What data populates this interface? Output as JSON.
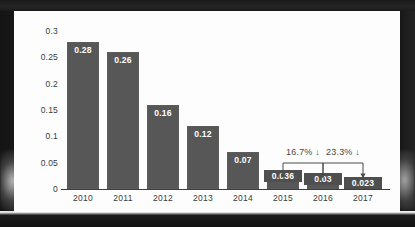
{
  "chart_data": {
    "type": "bar",
    "title": "",
    "xlabel": "",
    "ylabel": "",
    "categories": [
      "2010",
      "2011",
      "2012",
      "2013",
      "2014",
      "2015",
      "2016",
      "2017"
    ],
    "values": [
      0.28,
      0.26,
      0.16,
      0.12,
      0.07,
      0.036,
      0.03,
      0.023
    ],
    "value_labels": [
      "0.28",
      "0.26",
      "0.16",
      "0.12",
      "0.07",
      "0.036",
      "0.03",
      "0.023"
    ],
    "ylim": [
      0,
      0.3
    ],
    "yticks": [
      0,
      0.05,
      0.1,
      0.15,
      0.2,
      0.25,
      0.3
    ],
    "ytick_labels": [
      "0",
      "0.05",
      "0.1",
      "0.15",
      "0.2",
      "0.25",
      "0.3"
    ],
    "grid": false,
    "legend": "none",
    "bar_color": "#575757",
    "value_label_color": "#ffffff",
    "axis_color": "#3d3d3d",
    "tick_label_color": "#3a3a3a",
    "plot_background": "#fdfdfd",
    "annotations": [
      {
        "label": "16.7% ↓",
        "from_category": "2015",
        "to_category": "2016",
        "change_percent": -16.7,
        "direction": "down"
      },
      {
        "label": "23.3% ↓",
        "from_category": "2016",
        "to_category": "2017",
        "change_percent": -23.3,
        "direction": "down"
      }
    ],
    "annotation_color": "#4a4a4a"
  }
}
